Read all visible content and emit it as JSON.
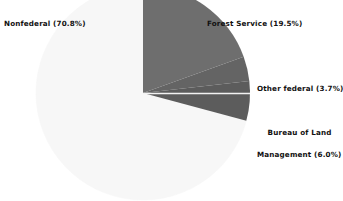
{
  "chart_data": {
    "type": "pie",
    "title": "",
    "xlabel": "",
    "ylabel": "",
    "legend_position": "callout-labels",
    "grid": false,
    "total_percent": 100.0,
    "categories": [
      "Nonfederal",
      "Forest Service",
      "Other federal",
      "Bureau of Land Management"
    ],
    "values": [
      70.8,
      19.5,
      3.7,
      6.0
    ],
    "units": "percent",
    "slices": [
      {
        "name": "Forest Service",
        "label": "Forest Service (19.5%)",
        "value": 19.5,
        "color": "#6e6e6e",
        "start_angle_deg": 0.0,
        "end_angle_deg": 70.2
      },
      {
        "name": "Other federal",
        "label": "Other federal (3.7%)",
        "value": 3.7,
        "color": "#646464",
        "start_angle_deg": 70.2,
        "end_angle_deg": 83.5
      },
      {
        "name": "Bureau of Land Management",
        "label_line1": "Bureau of Land",
        "label_line2": "Management (6.0%)",
        "label": "Bureau of Land Management (6.0%)",
        "value": 6.0,
        "color": "#5c5c5c",
        "start_angle_deg": 83.5,
        "end_angle_deg": 105.1
      },
      {
        "name": "Nonfederal",
        "label": "Nonfederal (70.8%)",
        "value": 70.8,
        "color": "#f7f7f7",
        "start_angle_deg": 105.1,
        "end_angle_deg": 360.0
      }
    ],
    "colors": {
      "background": "#ffffff",
      "text": "#111111",
      "separator": "#f2f2f2",
      "forest_service": "#6e6e6e",
      "other_federal": "#646464",
      "bureau_of_land_management": "#5c5c5c",
      "nonfederal": "#f7f7f7"
    },
    "geometry": {
      "center_x": 143,
      "center_y": 93,
      "radius": 107
    }
  },
  "labels": {
    "nonfederal": "Nonfederal (70.8%)",
    "forest_service": "Forest Service (19.5%)",
    "other_federal": "Other federal (3.7%)",
    "blm_line1": "Bureau of Land",
    "blm_line2": "Management (6.0%)"
  }
}
